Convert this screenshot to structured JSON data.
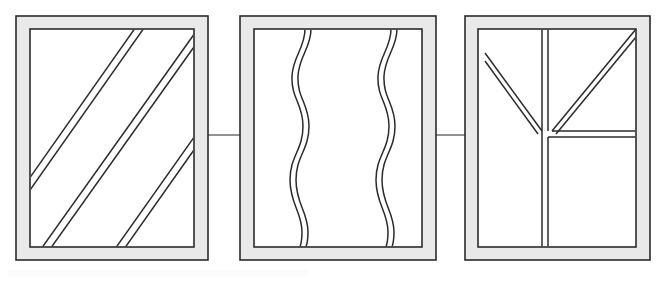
{
  "figure": {
    "canvas": {
      "width": 664,
      "height": 283,
      "background": "#ffffff"
    },
    "style": {
      "line_color": "#2b2b2b",
      "frame_band_fill": "#e9e9e9",
      "panel_fill": "#ffffff",
      "connector_color": "#4a4a4a",
      "frame_stroke_width": 1.6,
      "pattern_stroke_width": 1.5,
      "connector_stroke_width": 1.2
    },
    "panels": [
      {
        "id": "panel-1",
        "label": "Panel 1 - diagonal stripes",
        "pattern": "diagonal-double-lines",
        "outer": {
          "x": 16,
          "y": 16,
          "width": 192,
          "height": 244
        },
        "inner": {
          "x": 30,
          "y": 29,
          "width": 164,
          "height": 218
        },
        "band_thickness": 13,
        "stripe_count": 3,
        "stripe_pair_gap": 5,
        "stripe_angle_deg": 50,
        "stripes": [
          {
            "x1": 30,
            "y1": 178,
            "x2": 135,
            "y2": 29
          },
          {
            "x1": 35,
            "y1": 180,
            "x2": 140,
            "y2": 29
          },
          {
            "x1": 43,
            "y1": 247,
            "x2": 194,
            "y2": 34
          },
          {
            "x1": 49,
            "y1": 247,
            "x2": 194,
            "y2": 43
          },
          {
            "x1": 116,
            "y1": 247,
            "x2": 194,
            "y2": 137
          },
          {
            "x1": 122,
            "y1": 247,
            "x2": 194,
            "y2": 145
          }
        ]
      },
      {
        "id": "panel-2",
        "label": "Panel 2 - wavy vertical lines",
        "pattern": "wavy-double-lines",
        "outer": {
          "x": 240,
          "y": 16,
          "width": 196,
          "height": 244
        },
        "inner": {
          "x": 254,
          "y": 29,
          "width": 168,
          "height": 218
        },
        "band_thickness": 13,
        "wave_count": 2,
        "wave_pair_gap": 5,
        "wave_amplitude": 11,
        "wave_undulations": 3,
        "wave_centers_x": [
          301,
          387
        ]
      },
      {
        "id": "panel-3",
        "label": "Panel 3 - Y branching pattern",
        "pattern": "y-branch-double-lines",
        "outer": {
          "x": 465,
          "y": 16,
          "width": 185,
          "height": 244
        },
        "inner": {
          "x": 478,
          "y": 29,
          "width": 158,
          "height": 218
        },
        "band_thickness": 13,
        "junction": {
          "x": 545,
          "y": 133
        },
        "branches": [
          {
            "name": "upper-vertical-stem",
            "from": [
              545,
              29
            ],
            "to": [
              545,
              133
            ]
          },
          {
            "name": "left-diagonal-branch",
            "from": [
              487,
              55
            ],
            "to": [
              545,
              133
            ]
          },
          {
            "name": "right-diagonal-branch",
            "from": [
              634,
              31
            ],
            "to": [
              545,
              133
            ]
          },
          {
            "name": "lower-vertical-stem",
            "from": [
              545,
              133
            ],
            "to": [
              545,
              247
            ]
          },
          {
            "name": "right-horizontal-branch",
            "from": [
              545,
              133
            ],
            "to": [
              636,
              133
            ]
          }
        ]
      }
    ],
    "connectors": [
      {
        "id": "connector-1-2",
        "label": "Connector between panel 1 and panel 2",
        "x1": 208,
        "y1": 135,
        "x2": 240,
        "y2": 135
      },
      {
        "id": "connector-2-3",
        "label": "Connector between panel 2 and panel 3",
        "x1": 436,
        "y1": 135,
        "x2": 465,
        "y2": 135
      }
    ],
    "artifacts": [
      {
        "id": "bottom-scan-band",
        "label": "Faint scan artifact band along lower edge",
        "x": 8,
        "y": 270,
        "width": 300,
        "height": 7,
        "color": "#fbfbfb"
      }
    ]
  }
}
